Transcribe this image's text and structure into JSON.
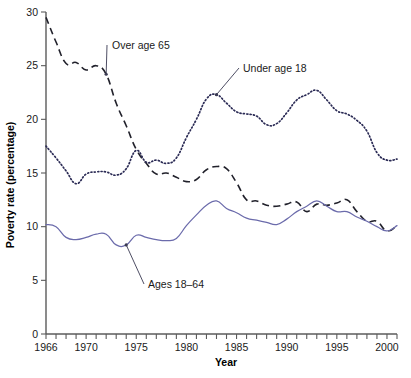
{
  "chart_data": {
    "type": "line",
    "title": "",
    "xlabel": "Year",
    "ylabel": "Poverty rate (percentage)",
    "xlim": [
      1966,
      2001
    ],
    "ylim": [
      0,
      30
    ],
    "grid": false,
    "legend_position": "inline-annotations",
    "x_ticks_major": [
      1966,
      1970,
      1975,
      1980,
      1985,
      1990,
      1995,
      2000
    ],
    "x_tick_labels": [
      "1966",
      "1970",
      "1975",
      "1980",
      "1985",
      "1990",
      "1995",
      "2000"
    ],
    "y_ticks": [
      0,
      5,
      10,
      15,
      20,
      25,
      30
    ],
    "y_tick_labels": [
      "0",
      "5",
      "10",
      "15",
      "20",
      "25",
      "30"
    ],
    "x": [
      1966,
      1967,
      1968,
      1969,
      1970,
      1971,
      1972,
      1973,
      1974,
      1975,
      1976,
      1977,
      1978,
      1979,
      1980,
      1981,
      1982,
      1983,
      1984,
      1985,
      1986,
      1987,
      1988,
      1989,
      1990,
      1991,
      1992,
      1993,
      1994,
      1995,
      1996,
      1997,
      1998,
      1999,
      2000,
      2001
    ],
    "series": [
      {
        "name": "Over age 65",
        "style": "dashed",
        "color": "#21212b",
        "label_text": "Over age 65",
        "values": [
          29.5,
          27.2,
          25.2,
          25.3,
          24.6,
          25.0,
          24.2,
          21.5,
          19.4,
          17.2,
          15.9,
          14.9,
          15.0,
          14.6,
          14.2,
          14.4,
          15.3,
          15.6,
          15.4,
          14.1,
          12.5,
          12.4,
          12.0,
          11.9,
          12.1,
          12.3,
          11.4,
          12.1,
          12.0,
          12.2,
          12.5,
          11.4,
          10.5,
          10.5,
          9.6,
          10.1
        ]
      },
      {
        "name": "Under age 18",
        "style": "dotted",
        "color": "#2b2b55",
        "label_text": "Under age 18",
        "values": [
          17.5,
          16.4,
          15.2,
          14.0,
          14.9,
          15.1,
          15.1,
          14.8,
          15.4,
          17.1,
          16.0,
          16.2,
          15.9,
          16.4,
          18.3,
          20.0,
          21.9,
          22.3,
          21.5,
          20.7,
          20.5,
          20.3,
          19.5,
          19.6,
          20.6,
          21.8,
          22.3,
          22.7,
          21.8,
          20.8,
          20.5,
          19.9,
          18.9,
          16.9,
          16.2,
          16.3
        ]
      },
      {
        "name": "Ages 18-64",
        "style": "solid",
        "color": "#6b6bab",
        "label_text": "Ages 18–64",
        "values": [
          10.2,
          10.0,
          9.0,
          8.8,
          9.0,
          9.3,
          9.3,
          8.3,
          8.3,
          9.2,
          9.0,
          8.8,
          8.7,
          8.9,
          10.1,
          11.1,
          12.0,
          12.4,
          11.7,
          11.3,
          10.8,
          10.6,
          10.4,
          10.2,
          10.7,
          11.4,
          11.9,
          12.4,
          11.9,
          11.4,
          11.4,
          10.9,
          10.5,
          10.0,
          9.6,
          10.1
        ]
      }
    ],
    "annotations": [
      {
        "text": "Over age 65",
        "target_year": 1972,
        "target_value": 24.2
      },
      {
        "text": "Under age 18",
        "target_year": 1983,
        "target_value": 22.3
      },
      {
        "text": "Ages 18–64",
        "target_year": 1974,
        "target_value": 8.3
      }
    ]
  },
  "axes": {
    "x_title": "Year",
    "y_title": "Poverty rate (percentage)"
  }
}
